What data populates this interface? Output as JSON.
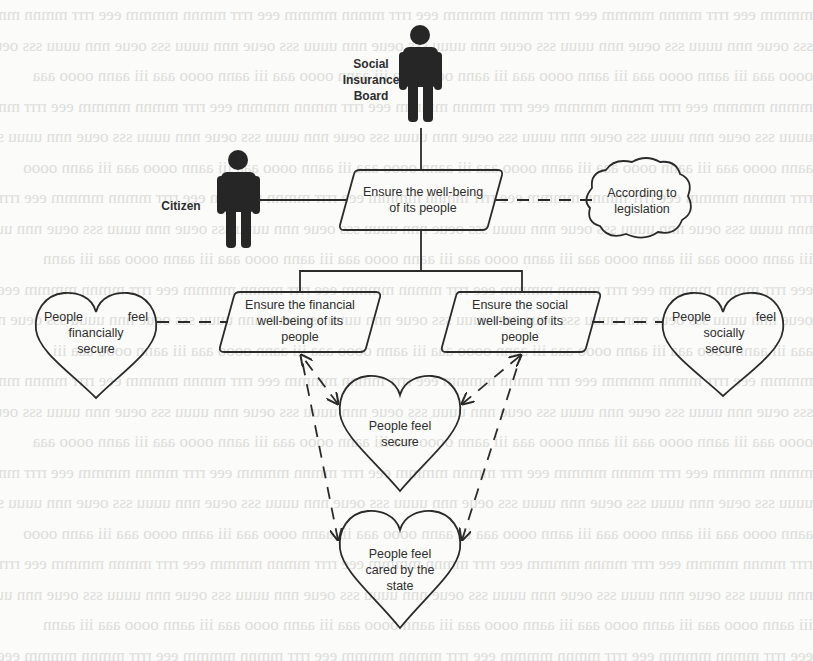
{
  "diagram": {
    "actors": [
      {
        "id": "board",
        "label_lines": [
          "Social",
          "Insurance",
          "Board"
        ]
      },
      {
        "id": "citizen",
        "label": "Citizen"
      }
    ],
    "goals": {
      "top": {
        "lines": [
          "Ensure the well-being",
          "of its people"
        ]
      },
      "financial": {
        "lines": [
          "Ensure the financial",
          "well-being of its",
          "people"
        ]
      },
      "social": {
        "lines": [
          "Ensure the social",
          "well-being of its",
          "people"
        ]
      }
    },
    "cloud": {
      "lines": [
        "According to",
        "legislation"
      ]
    },
    "hearts": {
      "financial": {
        "first_left": "People",
        "first_right": "feel",
        "lines": [
          "financially",
          "secure"
        ]
      },
      "social": {
        "first_left": "People",
        "first_right": "feel",
        "lines": [
          "socially",
          "secure"
        ]
      },
      "secure": {
        "lines": [
          "People feel",
          "secure"
        ]
      },
      "cared": {
        "lines": [
          "People feel",
          "cared by the",
          "state"
        ]
      }
    },
    "colors": {
      "stroke": "#2b2b2b",
      "actor_fill": "#262626",
      "background": "#fbfbf9"
    }
  }
}
